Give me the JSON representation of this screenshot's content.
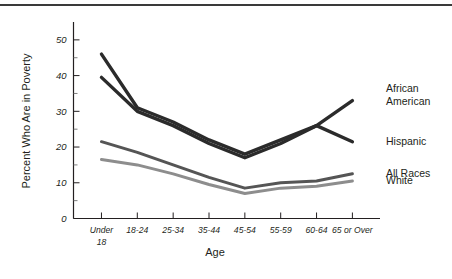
{
  "figure": {
    "y_axis_title": "Percent Who Are in Poverty",
    "x_axis_title": "Age",
    "top_rule": "horizontal-rule"
  },
  "chart_data": {
    "type": "line",
    "title": "",
    "xlabel": "Age",
    "ylabel": "Percent Who Are in Poverty",
    "categories": [
      "Under 18",
      "18-24",
      "25-34",
      "35-44",
      "45-54",
      "55-59",
      "60-64",
      "65 or Over"
    ],
    "category_lines": [
      [
        "Under",
        "18"
      ],
      [
        "18-24"
      ],
      [
        "25-34"
      ],
      [
        "35-44"
      ],
      [
        "45-54"
      ],
      [
        "55-59"
      ],
      [
        "60-64"
      ],
      [
        "65 or Over"
      ]
    ],
    "ylim": [
      0,
      55
    ],
    "yticks": [
      0,
      10,
      20,
      30,
      40,
      50
    ],
    "ytick_labels": [
      "0",
      "10",
      "20",
      "30",
      "40",
      "50"
    ],
    "y_minor_ticks": [
      5,
      15,
      25,
      35,
      45
    ],
    "grid": false,
    "legend_position": "right-inline-labels",
    "series": [
      {
        "name": "African American",
        "color": "#2b2b2b",
        "width": 3.4,
        "label_lines": [
          "African",
          "American"
        ],
        "values": [
          46,
          31,
          27,
          22,
          18,
          22,
          26,
          33
        ]
      },
      {
        "name": "Hispanic",
        "color": "#2b2b2b",
        "width": 3.4,
        "label_lines": [
          "Hispanic"
        ],
        "values": [
          39.5,
          30,
          26,
          21,
          17,
          21,
          26,
          21.5
        ]
      },
      {
        "name": "All Races",
        "color": "#555555",
        "width": 3.0,
        "label_lines": [
          "All Races"
        ],
        "values": [
          21.5,
          18.5,
          15,
          11.5,
          8.5,
          10,
          10.5,
          12.5
        ]
      },
      {
        "name": "White",
        "color": "#8d8d8d",
        "width": 3.0,
        "label_lines": [
          "White"
        ],
        "values": [
          16.5,
          15,
          12.5,
          9.5,
          7,
          8.5,
          9,
          10.5
        ]
      }
    ]
  }
}
